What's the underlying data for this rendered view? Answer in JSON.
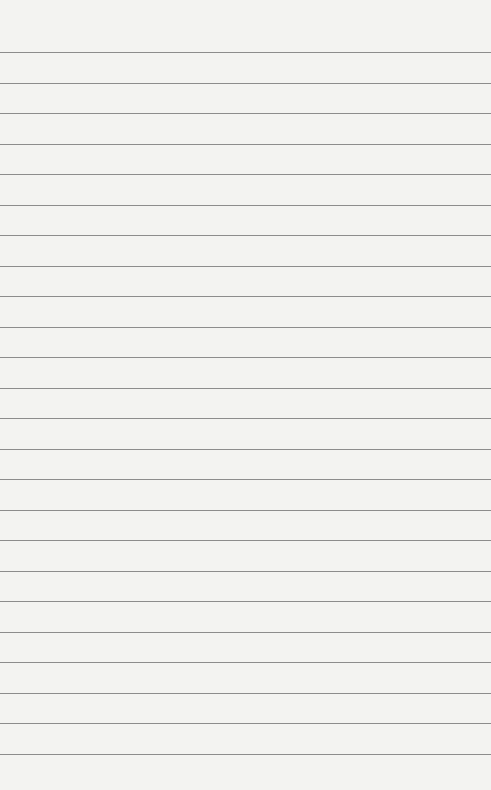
{
  "page": {
    "kind": "lined-paper",
    "background_color": "#f3f3f1",
    "line_color": "#8c8c8c",
    "first_line_y": 52,
    "line_spacing": 30.5,
    "line_count": 24
  }
}
